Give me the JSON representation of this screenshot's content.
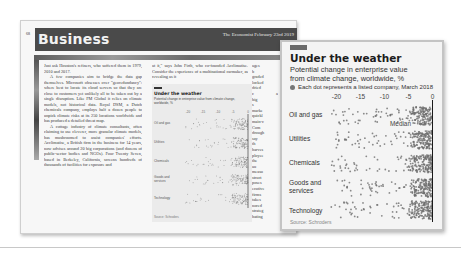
{
  "page": {
    "page_number": "68",
    "section_title": "Business",
    "masthead": "The Economist February 23rd 2019",
    "column1": [
      {
        "indent": false,
        "text": "Just ask Houston's refiners, who suffered them in 1979, 2010 and 2017."
      },
      {
        "indent": true,
        "text": "A few companies aim to bridge the data gap themselves. Microsoft obsesses over \"georedundancy\": where best to locate its cloud servers so that they are close to customers yet unlikely all to be taken out by a single disruption. Like FM Global it relies on climate models, not historical data. Royal DSM, a Dutch chemicals company, employs half a dozen people to unpick climate risks at its 250 locations worldwide and has produced a detailed threat map."
      },
      {
        "indent": true,
        "text": "A cottage industry of climate consultants, often claiming to use cleverer, more granular climate models, has mushroomed to assist companies' efforts. Acclimatise, a British firm in the business for 14 years, now advises around 20 big corporations (and dozens of public-sector bodies and NGOs). Four Twenty Seven, based in Berkeley, California, screens hundreds of thousands of facilities for exposure and"
      }
    ],
    "column2": "at it,\" says John Firth, who co-founded Acclimatise. Consider the experience of a multinational carmaker, as revealing as it",
    "column3": "ages b graded locked dried c a big s marke quickl main-c Com drough say th harves ployee the au measu struct poses ecutive firms takes nored strateg hating",
    "mini_chart": {
      "title": "Under the weather",
      "subtitle": "Potential change in enterprise value from climate change, worldwide, %",
      "legend": "Each dot represents a listed company, March 2018",
      "categories": [
        "Oil and gas",
        "Utilities",
        "Chemicals",
        "Goods and services",
        "Technology"
      ],
      "source": "Source: Schroders"
    }
  },
  "callout": {
    "title": "Under the weather",
    "subtitle_line1": "Potential change in enterprise value",
    "subtitle_line2": "from climate change, worldwide, %",
    "legend": "Each dot represents a listed company, March 2018",
    "median_label": "Median",
    "source": "Source: Schroders"
  },
  "colors": {
    "section_bar": "#4a4a4a",
    "dot": "#6e6e6e",
    "zero_line": "#1a1a1a",
    "callout_bg": "#f4f4f4"
  },
  "chart_data": {
    "type": "scatter",
    "subtype": "strip",
    "title": "Under the weather",
    "subtitle": "Potential change in enterprise value from climate change, worldwide, %",
    "legend": [
      "Each dot represents a listed company, March 2018"
    ],
    "xlabel": "%",
    "ylabel": "",
    "x_ticks": [
      -20,
      -15,
      -10,
      -5,
      0
    ],
    "xlim": [
      -22,
      0.5
    ],
    "categories": [
      "Oil and gas",
      "Utilities",
      "Chemicals",
      "Goods and services",
      "Technology"
    ],
    "annotations": [
      {
        "text": "Median",
        "category": "Oil and gas",
        "x": -4.5
      }
    ],
    "reference_line": {
      "x": 0,
      "label": "0"
    },
    "series": [
      {
        "name": "Oil and gas",
        "x_range": [
          -21,
          0
        ],
        "density": "spread, dense from -10 to 0",
        "approx_median": -4.5
      },
      {
        "name": "Utilities",
        "x_range": [
          -20,
          0
        ],
        "density": "clustered near -20, -12, dense from -5 to 0",
        "approx_median": -2.5
      },
      {
        "name": "Chemicals",
        "x_range": [
          -21,
          0
        ],
        "density": "sparse spread, dense block from -3 to 0",
        "approx_median": -2
      },
      {
        "name": "Goods and services",
        "x_range": [
          -20,
          0
        ],
        "density": "sparse spread, dense from -5 to 0",
        "approx_median": -2
      },
      {
        "name": "Technology",
        "x_range": [
          -21,
          0
        ],
        "density": "sparse spread, dense from -4 to 0",
        "approx_median": -1.5
      }
    ],
    "grid": false,
    "source": "Source: Schroders"
  }
}
